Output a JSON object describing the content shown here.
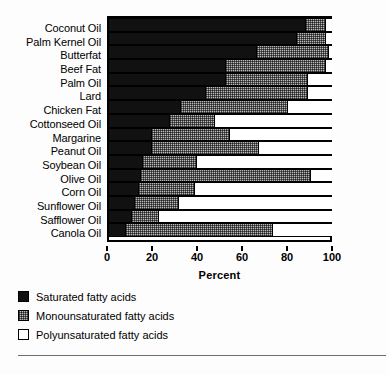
{
  "chart_data": {
    "type": "bar",
    "orientation": "horizontal",
    "stacked": true,
    "title": "",
    "xlabel": "Percent",
    "ylabel": "",
    "xlim": [
      0,
      100
    ],
    "xticks": [
      0,
      20,
      40,
      60,
      80,
      100
    ],
    "xticklabels": [
      "0",
      "20",
      "40",
      "60",
      "80",
      "100"
    ],
    "grid": false,
    "legend_position": "below-plot-left",
    "categories": [
      "Coconut Oil",
      "Palm Kernel Oil",
      "Butterfat",
      "Beef Fat",
      "Palm Oil",
      "Lard",
      "Chicken Fat",
      "Cottonseed Oil",
      "Margarine",
      "Peanut Oil",
      "Soybean Oil",
      "Olive Oil",
      "Corn Oil",
      "Sunflower Oil",
      "Safflower Oil",
      "Canola Oil"
    ],
    "series": [
      {
        "name": "Saturated fatty acids",
        "color": "#111111",
        "values": [
          88,
          84,
          66,
          52,
          52,
          43,
          32,
          27,
          19,
          19,
          15,
          14,
          13,
          11,
          10,
          7
        ]
      },
      {
        "name": "Monounsaturated fatty acids",
        "color": "#b9b9b9",
        "values": [
          9,
          13,
          32,
          45,
          37,
          46,
          48,
          20,
          35,
          48,
          24,
          76,
          25,
          20,
          12,
          66
        ]
      },
      {
        "name": "Polyunsaturated fatty acids",
        "color": "#ffffff",
        "values": [
          3,
          3,
          2,
          3,
          11,
          11,
          20,
          53,
          46,
          33,
          61,
          10,
          62,
          69,
          78,
          27
        ]
      }
    ]
  },
  "axis": {
    "x_title": "Percent"
  },
  "legend": {
    "items": [
      {
        "label": "Saturated fatty acids",
        "swatch": "black-filled-square"
      },
      {
        "label": "Monounsaturated fatty acids",
        "swatch": "gray-dotted-square"
      },
      {
        "label": "Polyunsaturated fatty acids",
        "swatch": "white-open-square"
      }
    ]
  }
}
